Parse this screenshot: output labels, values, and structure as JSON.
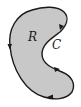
{
  "diagram": {
    "region_label": "R",
    "curve_label": "C",
    "colors": {
      "fill": "#c8c8c8",
      "stroke": "#1a1a1a",
      "background": "#ffffff"
    },
    "orientation": "counterclockwise",
    "arrow_count": 4
  }
}
